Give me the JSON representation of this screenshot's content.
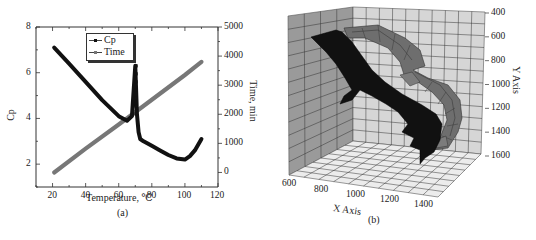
{
  "chart_data": [
    {
      "id": "a",
      "type": "line",
      "caption": "(a)",
      "title": "",
      "xlabel": "Temperature, ℃",
      "ylabel": "Cp",
      "y2label": "Time, min",
      "xlim": [
        10,
        120
      ],
      "ylim": [
        1,
        8
      ],
      "y2lim": [
        -500,
        5000
      ],
      "x_ticks": [
        20,
        40,
        60,
        80,
        100,
        120
      ],
      "y_ticks": [
        2,
        4,
        6,
        8
      ],
      "y2_ticks": [
        0,
        1000,
        2000,
        3000,
        4000,
        5000
      ],
      "grid": false,
      "legend_position": "upper-center",
      "legend": [
        "Cp",
        "Time"
      ],
      "series": [
        {
          "name": "Cp",
          "axis": "left",
          "color": "#111111",
          "marker": "square",
          "x": [
            21,
            30,
            40,
            50,
            60,
            65,
            68,
            70,
            71,
            71.5,
            72,
            73,
            75,
            80,
            85,
            90,
            95,
            100,
            103,
            106,
            110
          ],
          "y": [
            7.1,
            6.4,
            5.6,
            4.8,
            4.1,
            3.9,
            4.1,
            6.3,
            4.2,
            3.8,
            3.4,
            3.1,
            3.0,
            2.8,
            2.6,
            2.4,
            2.25,
            2.2,
            2.35,
            2.6,
            3.1
          ]
        },
        {
          "name": "Time",
          "axis": "right",
          "color": "#777777",
          "marker": "square",
          "x": [
            21,
            40,
            60,
            80,
            100,
            110
          ],
          "y": [
            0,
            820,
            1650,
            2500,
            3350,
            3800
          ]
        }
      ]
    },
    {
      "id": "b",
      "type": "surface3d",
      "caption": "(b)",
      "title": "",
      "xlabel": "X Axis",
      "ylabel": "Y Axis",
      "x_ticks": [
        600,
        800,
        1000,
        1200,
        1400
      ],
      "y_ticks": [
        400,
        600,
        800,
        1000,
        1200,
        1400,
        1600
      ],
      "grid": true,
      "series": [
        {
          "name": "dark surface",
          "color": "#111111"
        },
        {
          "name": "gray surface",
          "color": "#6e6e6e"
        }
      ]
    }
  ],
  "colors": {
    "cp_line": "#111111",
    "time_line": "#777777",
    "left_wall": "#9a9a9a",
    "back_wall": "#d6d6d6",
    "floor": "#e8e8e8",
    "dark_surface": "#111111",
    "gray_surface": "#6e6e6e"
  }
}
